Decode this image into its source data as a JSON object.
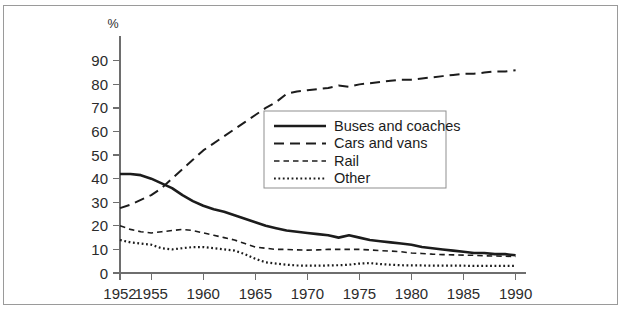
{
  "figure": {
    "unit_label": "%",
    "border_color": "#9a9a9a",
    "axis_color": "#6e6e6e",
    "ink_color": "#1c1c1c"
  },
  "chart_data": {
    "type": "line",
    "title": "",
    "xlabel": "",
    "ylabel": "%",
    "xlim": [
      1952,
      1991
    ],
    "ylim": [
      0,
      95
    ],
    "yticks": [
      0,
      10,
      20,
      30,
      40,
      50,
      60,
      70,
      80,
      90
    ],
    "xticks": [
      1952,
      1955,
      1960,
      1965,
      1970,
      1975,
      1980,
      1985,
      1990
    ],
    "grid": false,
    "legend_position": "center",
    "x": [
      1952,
      1953,
      1954,
      1955,
      1956,
      1957,
      1958,
      1959,
      1960,
      1961,
      1962,
      1963,
      1964,
      1965,
      1966,
      1967,
      1968,
      1969,
      1970,
      1971,
      1972,
      1973,
      1974,
      1975,
      1976,
      1977,
      1978,
      1979,
      1980,
      1981,
      1982,
      1983,
      1984,
      1985,
      1986,
      1987,
      1988,
      1989,
      1990
    ],
    "series": [
      {
        "name": "Buses and coaches",
        "style": "solid",
        "dash": "none",
        "width": 2.6,
        "color": "#1c1c1c",
        "values": [
          42,
          42,
          41.5,
          40,
          38,
          36,
          33,
          30.5,
          28.5,
          27,
          26,
          24.5,
          23,
          21.5,
          20,
          19,
          18,
          17.5,
          17,
          16.5,
          16,
          15,
          16,
          15,
          14,
          13.5,
          13,
          12.5,
          12,
          11,
          10.5,
          10,
          9.5,
          9,
          8.5,
          8.5,
          8,
          8,
          7.5
        ]
      },
      {
        "name": "Cars and vans",
        "style": "long-dash",
        "dash": "10,6",
        "width": 2.0,
        "color": "#1c1c1c",
        "values": [
          27.5,
          29,
          31,
          33,
          36,
          40,
          44,
          48,
          52,
          55,
          58,
          61,
          64,
          67,
          70,
          72.5,
          76,
          77,
          77.5,
          78,
          78.5,
          79.5,
          79,
          80,
          80.5,
          81,
          81.5,
          82,
          82,
          82.5,
          83,
          83.5,
          84,
          84.5,
          84.5,
          85,
          85.5,
          85.5,
          86
        ]
      },
      {
        "name": "Rail",
        "style": "short-dash",
        "dash": "5.5,4",
        "width": 1.6,
        "color": "#1c1c1c",
        "values": [
          20,
          18.5,
          17.5,
          17,
          17.5,
          18,
          18.5,
          18,
          17,
          16,
          15,
          14,
          12.5,
          11,
          10.5,
          10,
          10,
          9.8,
          9.7,
          9.8,
          10,
          10,
          10,
          10,
          9.8,
          9.5,
          9.3,
          9,
          8.5,
          8.3,
          8,
          7.8,
          7.7,
          7.6,
          7.5,
          7.3,
          7.2,
          7.1,
          7
        ]
      },
      {
        "name": "Other",
        "style": "dotted",
        "dash": "1.8,2.6",
        "width": 2.2,
        "color": "#1c1c1c",
        "values": [
          14,
          13,
          12.5,
          12,
          10.5,
          10,
          10.5,
          11,
          11,
          10.5,
          10,
          9.5,
          8,
          6,
          4.5,
          4,
          3.5,
          3.2,
          3.1,
          3.1,
          3.2,
          3.3,
          3.5,
          4,
          4.2,
          3.8,
          3.5,
          3.3,
          3.2,
          3.2,
          3.1,
          3.1,
          3.1,
          3.1,
          3,
          3,
          3,
          3,
          3
        ]
      }
    ]
  },
  "legend": {
    "items": [
      {
        "label": "Buses and coaches",
        "style": "solid"
      },
      {
        "label": "Cars and vans",
        "style": "long-dash"
      },
      {
        "label": "Rail",
        "style": "short-dash"
      },
      {
        "label": "Other",
        "style": "dotted"
      }
    ]
  }
}
